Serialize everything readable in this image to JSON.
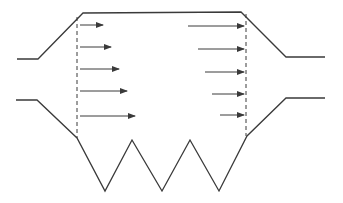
{
  "diagram": {
    "title": "",
    "stroke_color": "#3a3a3a",
    "walls": {
      "upper": [
        [
          17,
          59
        ],
        [
          38,
          59
        ],
        [
          83,
          13
        ],
        [
          241,
          12
        ],
        [
          286,
          57
        ],
        [
          325,
          57
        ]
      ],
      "lower": [
        [
          16,
          100
        ],
        [
          37,
          100
        ],
        [
          77,
          138
        ],
        [
          105,
          191
        ],
        [
          132,
          140
        ],
        [
          162,
          191
        ],
        [
          190,
          140
        ],
        [
          219,
          191
        ],
        [
          247,
          136
        ],
        [
          286,
          98
        ],
        [
          325,
          98
        ]
      ]
    },
    "dashed_sections": [
      {
        "name": "inlet-section",
        "x": 77,
        "y1": 17,
        "y2": 138
      },
      {
        "name": "outlet-section",
        "x": 246,
        "y1": 14,
        "y2": 136
      }
    ],
    "inlet_arrows": [
      {
        "y": 25,
        "x1": 80,
        "x2": 103
      },
      {
        "y": 47,
        "x1": 80,
        "x2": 111
      },
      {
        "y": 69,
        "x1": 80,
        "x2": 119
      },
      {
        "y": 91,
        "x1": 80,
        "x2": 127
      },
      {
        "y": 116,
        "x1": 80,
        "x2": 135
      }
    ],
    "outlet_arrows": [
      {
        "y": 26,
        "x1": 188,
        "x2": 244
      },
      {
        "y": 49,
        "x1": 198,
        "x2": 244
      },
      {
        "y": 72,
        "x1": 205,
        "x2": 244
      },
      {
        "y": 94,
        "x1": 212,
        "x2": 244
      },
      {
        "y": 115,
        "x1": 220,
        "x2": 244
      }
    ]
  }
}
